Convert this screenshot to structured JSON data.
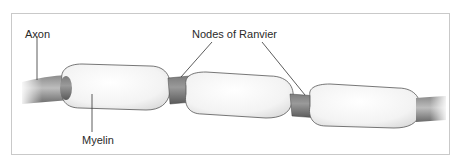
{
  "diagram": {
    "type": "myelinated-axon",
    "labels": {
      "axon": "Axon",
      "nodes": "Nodes of Ranvier",
      "myelin": "Myelin"
    },
    "colors": {
      "axon_dark": "#6e6e6e",
      "axon_light": "#b8b8b8",
      "myelin_fill": "#f4f4f4",
      "myelin_edge": "#555555",
      "frame": "#c9c9c9",
      "leader": "#333333"
    },
    "myelin_segments": 3,
    "nodes_count": 2
  }
}
